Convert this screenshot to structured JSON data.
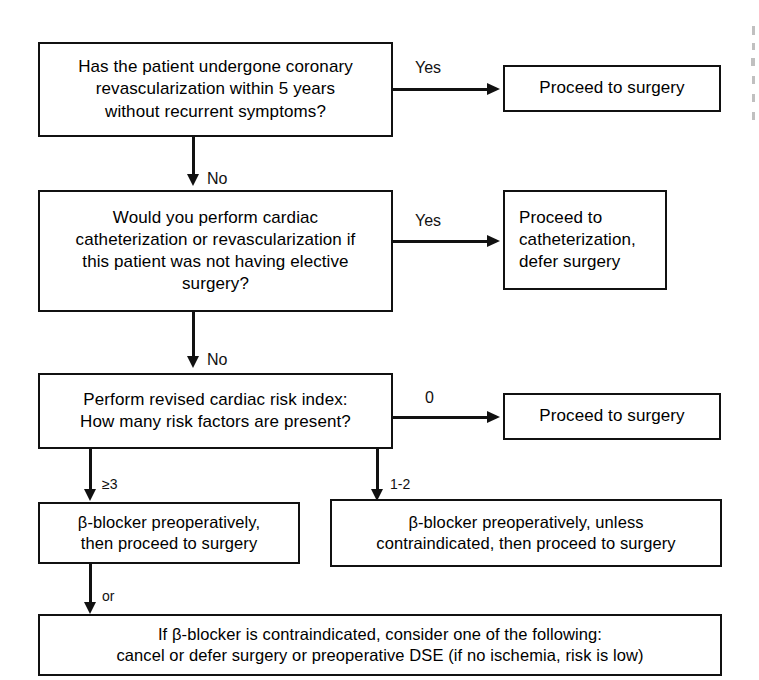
{
  "diagram": {
    "nodes": {
      "q1": "Has the patient undergone coronary\nrevascularization within 5 years\nwithout recurrent symptoms?",
      "r1": "Proceed to surgery",
      "q2": "Would you perform cardiac\ncatheterization or revascularization if\nthis patient was not having elective\nsurgery?",
      "r2": "Proceed to\ncatheterization,\ndefer surgery",
      "q3": "Perform revised cardiac risk index:\nHow many risk factors are present?",
      "r3": "Proceed to surgery",
      "b1": "β-blocker preoperatively,\nthen proceed to surgery",
      "b2": "β-blocker preoperatively, unless\ncontraindicated, then proceed to surgery",
      "b3": "If β-blocker is contraindicated, consider one of the following:\ncancel or defer surgery or preoperative DSE (if no ischemia, risk is low)"
    },
    "edges": {
      "q1_yes": "Yes",
      "q1_no": "No",
      "q2_yes": "Yes",
      "q2_no": "No",
      "q3_zero": "0",
      "q3_three_plus": "≥3",
      "q3_one_two": "1-2",
      "b1_or": "or"
    },
    "colors": {
      "stroke": "#111111",
      "background": "#ffffff",
      "text": "#000000"
    }
  }
}
